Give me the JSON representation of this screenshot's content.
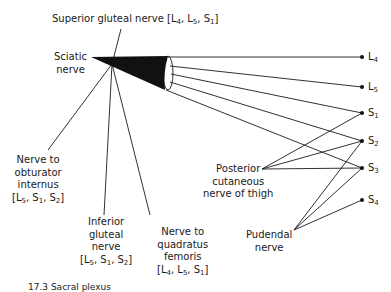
{
  "diagram": {
    "source_nerve": {
      "line1": "Sciatic",
      "line2": "nerve"
    },
    "top_branch": {
      "label": "Superior gluteal nerve",
      "roots": [
        [
          "L",
          "4"
        ],
        [
          "L",
          "5"
        ],
        [
          "S",
          "1"
        ]
      ]
    },
    "lower_branches": [
      {
        "id": "nerve-to-obturator-internus",
        "lines": [
          "Nerve to",
          "obturator",
          "internus"
        ],
        "roots": [
          [
            "L",
            "5"
          ],
          [
            "S",
            "1"
          ],
          [
            "S",
            "2"
          ]
        ]
      },
      {
        "id": "inferior-gluteal-nerve",
        "lines": [
          "Inferior",
          "gluteal",
          "nerve"
        ],
        "roots": [
          [
            "L",
            "5"
          ],
          [
            "S",
            "1"
          ],
          [
            "S",
            "2"
          ]
        ]
      },
      {
        "id": "nerve-to-quadratus-femoris",
        "lines": [
          "Nerve to",
          "quadratus",
          "femoris"
        ],
        "roots": [
          [
            "L",
            "4"
          ],
          [
            "L",
            "5"
          ],
          [
            "S",
            "1"
          ]
        ]
      }
    ],
    "spinal_roots": [
      {
        "letter": "L",
        "num": "4"
      },
      {
        "letter": "L",
        "num": "5"
      },
      {
        "letter": "S",
        "num": "1"
      },
      {
        "letter": "S",
        "num": "2"
      },
      {
        "letter": "S",
        "num": "3"
      },
      {
        "letter": "S",
        "num": "4"
      }
    ],
    "side_nerves": [
      {
        "id": "posterior-cutaneous-nerve-of-thigh",
        "lines": [
          "Posterior",
          "cutaneous",
          "nerve of thigh"
        ],
        "roots": [
          "S1",
          "S2",
          "S3"
        ]
      },
      {
        "id": "pudendal-nerve",
        "lines": [
          "Pudendal",
          "nerve"
        ],
        "roots": [
          "S2",
          "S3",
          "S4"
        ]
      }
    ],
    "sciatic_roots": [
      "L4",
      "L5",
      "S1",
      "S2",
      "S3"
    ],
    "caption": "17.3 Sacral plexus"
  }
}
